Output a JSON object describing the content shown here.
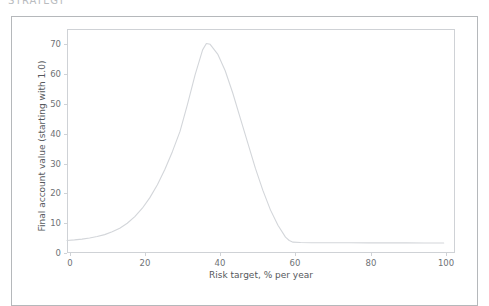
{
  "heading": {
    "text": "STRATEGY"
  },
  "chart_data": {
    "type": "line",
    "title": "",
    "xlabel": "Risk target, % per year",
    "ylabel": "Final account value (starting with 1.0)",
    "xlim": [
      0,
      103
    ],
    "ylim": [
      -3.5,
      77
    ],
    "xticks": [
      0,
      20,
      40,
      60,
      80,
      100
    ],
    "xticklabels": [
      "0",
      "20",
      "40",
      "60",
      "80",
      "100"
    ],
    "yticks": [
      0,
      10,
      20,
      30,
      40,
      50,
      60,
      70
    ],
    "yticklabels": [
      "0",
      "10",
      "20",
      "30",
      "40",
      "50",
      "60",
      "70"
    ],
    "grid": false,
    "legend": null,
    "line_color": "#d3d6da",
    "series": [
      {
        "name": "Final account value",
        "x": [
          0,
          2,
          4,
          6,
          8,
          10,
          12,
          14,
          16,
          18,
          20,
          22,
          24,
          26,
          28,
          30,
          32,
          34,
          36,
          37,
          38,
          40,
          42,
          44,
          46,
          48,
          50,
          52,
          54,
          56,
          58,
          59,
          60,
          62,
          65,
          70,
          75,
          80,
          85,
          90,
          95,
          100
        ],
        "y": [
          1.0,
          1.2,
          1.5,
          1.9,
          2.4,
          3.1,
          4.1,
          5.4,
          7.2,
          9.6,
          12.6,
          16.4,
          21.0,
          26.6,
          33.0,
          40.2,
          50.0,
          60.5,
          69.5,
          71.8,
          71.5,
          68.0,
          62.0,
          54.0,
          45.0,
          36.0,
          27.0,
          19.0,
          12.0,
          6.5,
          2.2,
          1.0,
          0.4,
          0.25,
          0.2,
          0.18,
          0.16,
          0.15,
          0.14,
          0.13,
          0.12,
          0.1
        ]
      }
    ]
  }
}
